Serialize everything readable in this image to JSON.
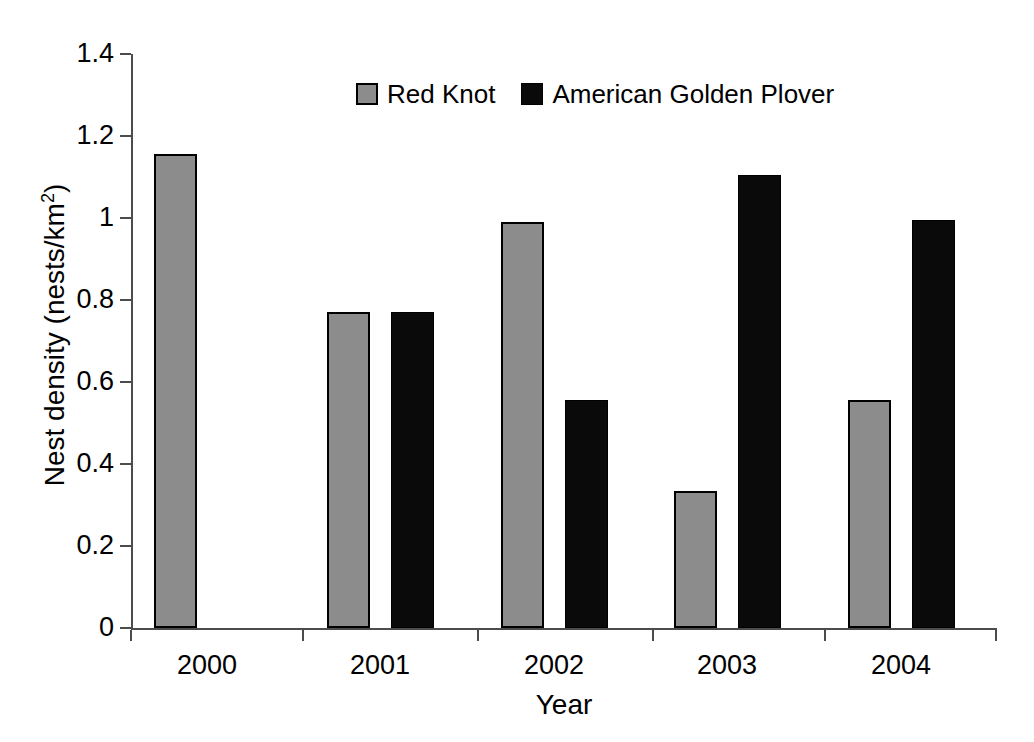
{
  "chart_data": {
    "type": "bar",
    "title": "",
    "xlabel": "Year",
    "ylabel": "Nest density (nests/km²)",
    "ylabel_main": "Nest density (nests/km",
    "ylabel_exponent": "2",
    "ylabel_close": ")",
    "categories": [
      "2000",
      "2001",
      "2002",
      "2003",
      "2004"
    ],
    "ylim": [
      0,
      1.4
    ],
    "ytick_labels": [
      "1.4",
      "1.2",
      "1",
      "0.8",
      "0.6",
      "0.4",
      "0.2",
      "0"
    ],
    "ytick_values": [
      1.4,
      1.2,
      1.0,
      0.8,
      0.6,
      0.4,
      0.2,
      0
    ],
    "grid": false,
    "legend_position": "top-center",
    "series": [
      {
        "name": "Red Knot",
        "color": "#8c8c8c",
        "values": [
          1.155,
          0.77,
          0.99,
          0.335,
          0.555
        ]
      },
      {
        "name": "American Golden Plover",
        "color": "#0a0a0a",
        "values": [
          null,
          0.77,
          0.555,
          1.105,
          0.995
        ]
      }
    ]
  },
  "legend": {
    "entries": [
      {
        "label": "Red Knot"
      },
      {
        "label": "American Golden Plover"
      }
    ]
  }
}
